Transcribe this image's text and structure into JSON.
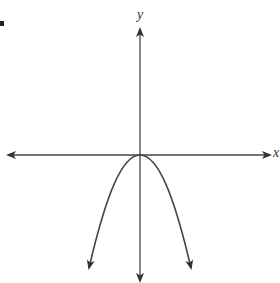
{
  "figure": {
    "marker_label": "",
    "axes": {
      "x_label": "x",
      "y_label": "y"
    },
    "curve": {
      "description": "Downward-opening parabola with vertex at the origin, both ends pointing downward",
      "vertex": [
        0,
        0
      ],
      "direction": "opens downward"
    },
    "colors": {
      "axis": "#333333",
      "curve": "#444444",
      "background": "#ffffff"
    }
  }
}
